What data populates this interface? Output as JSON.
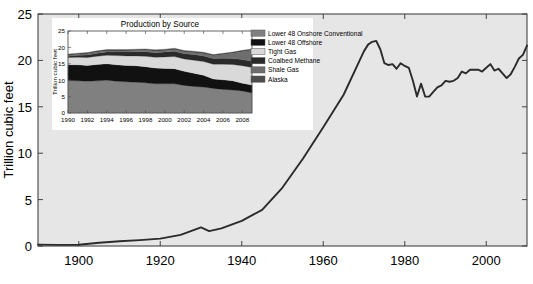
{
  "figure": {
    "background_color": "#ffffff",
    "axes_background_color": "#e6e6e6",
    "line_color": "#2b2b2b"
  },
  "chart_data": [
    {
      "id": "main",
      "type": "line",
      "title": "",
      "xlabel": "",
      "ylabel": "Trillion cubic feet",
      "xlim": [
        1890,
        2010
      ],
      "ylim": [
        0,
        25
      ],
      "grid": false,
      "xticks": [
        1900,
        1920,
        1940,
        1960,
        1980,
        2000
      ],
      "xtick_labels": [
        "1900",
        "1920",
        "1940",
        "1960",
        "1980",
        "2000"
      ],
      "yticks": [
        0,
        5,
        10,
        15,
        20,
        25
      ],
      "ytick_labels": [
        "0",
        "5",
        "10",
        "15",
        "20",
        "25"
      ],
      "series": [
        {
          "name": "US Natural Gas Production",
          "x": [
            1890,
            1895,
            1900,
            1905,
            1910,
            1915,
            1920,
            1925,
            1930,
            1932,
            1935,
            1940,
            1945,
            1950,
            1955,
            1960,
            1965,
            1970,
            1971,
            1972,
            1973,
            1974,
            1975,
            1976,
            1977,
            1978,
            1979,
            1980,
            1981,
            1982,
            1983,
            1984,
            1985,
            1986,
            1987,
            1988,
            1989,
            1990,
            1991,
            1992,
            1993,
            1994,
            1995,
            1996,
            1997,
            1998,
            1999,
            2000,
            2001,
            2002,
            2003,
            2004,
            2005,
            2006,
            2007,
            2008,
            2009,
            2010
          ],
          "y": [
            0.15,
            0.12,
            0.13,
            0.35,
            0.51,
            0.63,
            0.8,
            1.2,
            2.0,
            1.6,
            1.9,
            2.7,
            3.9,
            6.3,
            9.4,
            12.8,
            16.3,
            21.0,
            21.7,
            22.0,
            22.1,
            21.2,
            19.7,
            19.5,
            19.6,
            19.1,
            19.7,
            19.4,
            19.2,
            17.8,
            16.1,
            17.5,
            16.1,
            16.1,
            16.6,
            17.1,
            17.3,
            17.8,
            17.7,
            17.8,
            18.1,
            18.8,
            18.6,
            19.0,
            19.0,
            19.0,
            18.8,
            19.2,
            19.6,
            18.9,
            19.1,
            18.6,
            18.1,
            18.5,
            19.3,
            20.2,
            20.6,
            21.6
          ]
        }
      ]
    },
    {
      "id": "inset",
      "type": "area",
      "title": "Production by Source",
      "xlabel": "",
      "ylabel": "Trillion cubic feet",
      "xlim": [
        1990,
        2009
      ],
      "ylim": [
        0,
        25
      ],
      "grid": false,
      "legend_position": "right",
      "xticks": [
        1990,
        1992,
        1994,
        1996,
        1998,
        2000,
        2002,
        2004,
        2006,
        2008
      ],
      "xtick_labels": [
        "1990",
        "1992",
        "1994",
        "1996",
        "1998",
        "2000",
        "2002",
        "2004",
        "2006",
        "2008"
      ],
      "yticks": [
        0,
        5,
        10,
        15,
        20,
        25
      ],
      "ytick_labels": [
        "0",
        "5",
        "10",
        "15",
        "20",
        "25"
      ],
      "x": [
        1990,
        1991,
        1992,
        1993,
        1994,
        1995,
        1996,
        1997,
        1998,
        1999,
        2000,
        2001,
        2002,
        2003,
        2004,
        2005,
        2006,
        2007,
        2008,
        2009
      ],
      "stack_order_bottom_to_top": [
        "Lower 48 Onshore Conventional",
        "Lower 48 Offshore",
        "Tight Gas",
        "Coalbed Methane",
        "Shale Gas",
        "Alaska"
      ],
      "series": [
        {
          "name": "Lower 48 Onshore Conventional",
          "color": "#808080",
          "values": [
            9.9,
            9.8,
            9.7,
            9.8,
            10.0,
            9.7,
            9.5,
            9.4,
            9.2,
            8.9,
            8.9,
            8.9,
            8.4,
            8.1,
            7.9,
            7.5,
            7.2,
            7.0,
            6.7,
            6.1
          ]
        },
        {
          "name": "Lower 48 Offshore",
          "color": "#111111",
          "values": [
            4.8,
            4.9,
            4.8,
            5.0,
            5.0,
            5.0,
            5.0,
            5.0,
            4.9,
            4.8,
            4.7,
            4.6,
            4.3,
            4.0,
            3.6,
            2.9,
            2.9,
            2.8,
            2.4,
            2.4
          ]
        },
        {
          "name": "Tight Gas",
          "color": "#d9d9d9",
          "values": [
            2.2,
            2.3,
            2.4,
            2.5,
            2.6,
            2.8,
            2.9,
            3.0,
            3.2,
            3.3,
            3.5,
            3.7,
            3.8,
            4.0,
            4.2,
            4.5,
            4.8,
            5.0,
            5.3,
            5.4
          ]
        },
        {
          "name": "Coalbed Methane",
          "color": "#2a2a2a",
          "values": [
            0.4,
            0.6,
            0.8,
            0.9,
            1.0,
            1.1,
            1.2,
            1.3,
            1.4,
            1.4,
            1.5,
            1.6,
            1.6,
            1.7,
            1.7,
            1.7,
            1.8,
            1.8,
            1.9,
            1.9
          ]
        },
        {
          "name": "Shale Gas",
          "color": "#6e6e6e",
          "values": [
            0.2,
            0.2,
            0.3,
            0.3,
            0.3,
            0.3,
            0.3,
            0.3,
            0.4,
            0.4,
            0.4,
            0.5,
            0.5,
            0.6,
            0.7,
            0.8,
            1.1,
            1.6,
            2.4,
            3.3
          ]
        },
        {
          "name": "Alaska",
          "color": "#4d4d4d",
          "values": [
            0.45,
            0.45,
            0.45,
            0.45,
            0.45,
            0.45,
            0.45,
            0.45,
            0.45,
            0.45,
            0.45,
            0.45,
            0.45,
            0.45,
            0.45,
            0.45,
            0.4,
            0.4,
            0.4,
            0.4
          ]
        }
      ],
      "legend": [
        {
          "label": "Lower 48 Onshore Conventional",
          "color": "#808080"
        },
        {
          "label": "Lower 48 Offshore",
          "color": "#111111"
        },
        {
          "label": "Tight Gas",
          "color": "#d9d9d9"
        },
        {
          "label": "Coalbed Methane",
          "color": "#2a2a2a"
        },
        {
          "label": "Shale Gas",
          "color": "#6e6e6e"
        },
        {
          "label": "Alaska",
          "color": "#4d4d4d"
        }
      ]
    }
  ]
}
